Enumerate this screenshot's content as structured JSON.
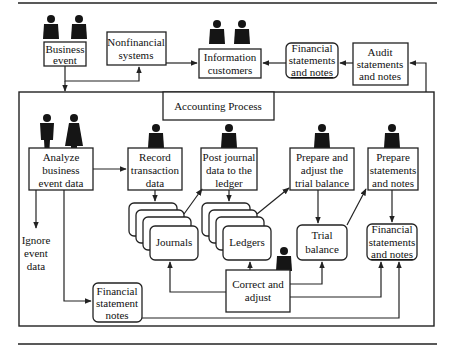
{
  "diagram": {
    "title": "Accounting Process",
    "external": {
      "business_event": [
        "Business",
        "event"
      ],
      "nonfinancial_systems": [
        "Nonfinancial",
        "systems"
      ],
      "information_customers": [
        "Information",
        "customers"
      ],
      "financial_statements_top": [
        "Financial",
        "statements",
        "and notes"
      ],
      "audit_statements": [
        "Audit",
        "statements",
        "and notes"
      ]
    },
    "process_steps": {
      "analyze": [
        "Analyze",
        "business",
        "event data"
      ],
      "record": [
        "Record",
        "transaction",
        "data"
      ],
      "post": [
        "Post journal",
        "data to the",
        "ledger"
      ],
      "prepare_trial": [
        "Prepare and",
        "adjust the",
        "trial balance"
      ],
      "prepare_statements": [
        "Prepare",
        "statements",
        "and notes"
      ],
      "correct": [
        "Correct  and",
        "adjust"
      ]
    },
    "data_stores": {
      "journals": "Journals",
      "ledgers": "Ledgers",
      "trial_balance": [
        "Trial",
        "balance"
      ],
      "financial_statements": [
        "Financial",
        "statements",
        "and notes"
      ],
      "fs_notes": [
        "Financial",
        "statement",
        "notes"
      ]
    },
    "terminal": {
      "ignore": [
        "Ignore",
        "event",
        "data"
      ]
    },
    "colors": {
      "line": "#222222",
      "figure": "#151515",
      "background": "#ffffff"
    }
  }
}
